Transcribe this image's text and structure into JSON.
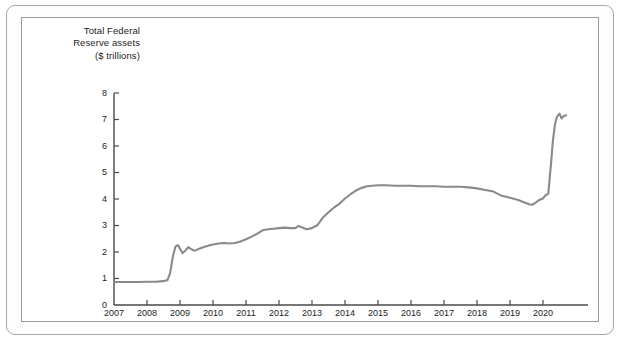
{
  "figure": {
    "title_lines": "Total Federal\nReserve assets\n($ trillions)",
    "line_color": "#8a8a8a",
    "axis_color": "#4a4a4a",
    "frame_color": "#9a9a9a",
    "background": "#ffffff"
  },
  "chart_data": {
    "type": "line",
    "title": "Total Federal Reserve assets ($ trillions)",
    "xlabel": "",
    "ylabel": "$ trillions",
    "xlim": [
      2007,
      2020.75
    ],
    "ylim": [
      0,
      8
    ],
    "yticks": [
      0,
      1,
      2,
      3,
      4,
      5,
      6,
      7,
      8
    ],
    "ytick_labels": [
      "0",
      "1",
      "2",
      "3",
      "4",
      "5",
      "6",
      "7",
      "8"
    ],
    "xticks": [
      2007,
      2008,
      2009,
      2010,
      2011,
      2012,
      2013,
      2014,
      2015,
      2016,
      2017,
      2018,
      2019,
      2020
    ],
    "xtick_labels": [
      "2007",
      "2008",
      "2009",
      "2010",
      "2011",
      "2012",
      "2013",
      "2014",
      "2015",
      "2016",
      "2017",
      "2018",
      "2019",
      "2020"
    ],
    "grid": false,
    "legend": null,
    "series": [
      {
        "name": "Total Federal Reserve assets",
        "units": "$ trillions",
        "x": [
          2007.0,
          2007.25,
          2007.5,
          2007.75,
          2008.0,
          2008.25,
          2008.5,
          2008.62,
          2008.7,
          2008.78,
          2008.86,
          2008.94,
          2009.0,
          2009.08,
          2009.16,
          2009.25,
          2009.33,
          2009.42,
          2009.5,
          2009.62,
          2009.75,
          2009.88,
          2010.0,
          2010.17,
          2010.33,
          2010.5,
          2010.67,
          2010.83,
          2011.0,
          2011.17,
          2011.33,
          2011.5,
          2011.67,
          2011.83,
          2012.0,
          2012.17,
          2012.33,
          2012.5,
          2012.58,
          2012.67,
          2012.83,
          2013.0,
          2013.17,
          2013.33,
          2013.5,
          2013.67,
          2013.83,
          2014.0,
          2014.17,
          2014.33,
          2014.5,
          2014.67,
          2014.83,
          2015.0,
          2015.25,
          2015.5,
          2015.75,
          2016.0,
          2016.25,
          2016.5,
          2016.75,
          2017.0,
          2017.25,
          2017.5,
          2017.75,
          2018.0,
          2018.25,
          2018.5,
          2018.75,
          2019.0,
          2019.25,
          2019.42,
          2019.58,
          2019.67,
          2019.75,
          2019.88,
          2020.0,
          2020.08,
          2020.16,
          2020.24,
          2020.3,
          2020.36,
          2020.42,
          2020.5,
          2020.56,
          2020.62,
          2020.7
        ],
        "y": [
          0.87,
          0.87,
          0.87,
          0.87,
          0.88,
          0.88,
          0.9,
          0.94,
          1.2,
          1.8,
          2.2,
          2.26,
          2.12,
          1.96,
          2.05,
          2.18,
          2.12,
          2.05,
          2.08,
          2.14,
          2.2,
          2.25,
          2.28,
          2.32,
          2.34,
          2.32,
          2.34,
          2.4,
          2.48,
          2.58,
          2.68,
          2.82,
          2.86,
          2.88,
          2.9,
          2.92,
          2.9,
          2.9,
          2.98,
          2.94,
          2.86,
          2.9,
          3.02,
          3.3,
          3.5,
          3.68,
          3.82,
          4.02,
          4.18,
          4.32,
          4.42,
          4.48,
          4.5,
          4.52,
          4.52,
          4.5,
          4.5,
          4.5,
          4.48,
          4.48,
          4.48,
          4.46,
          4.46,
          4.46,
          4.44,
          4.4,
          4.34,
          4.28,
          4.12,
          4.05,
          3.96,
          3.88,
          3.8,
          3.78,
          3.84,
          3.96,
          4.02,
          4.15,
          4.2,
          5.3,
          6.2,
          6.8,
          7.1,
          7.22,
          7.04,
          7.12,
          7.16
        ]
      }
    ]
  }
}
